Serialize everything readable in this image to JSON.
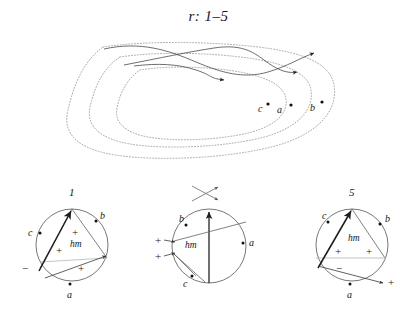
{
  "figure": {
    "title": "r: 1–5",
    "type": "braid-and-circle-diagram"
  },
  "braid": {
    "name": "dotted-loop-braid",
    "point_labels": [
      {
        "label": "c",
        "x": 262,
        "y": 110
      },
      {
        "label": "a",
        "x": 278,
        "y": 110
      },
      {
        "label": "b",
        "x": 309,
        "y": 110
      }
    ],
    "arrow_count": 3,
    "dotted_loop_count": 3,
    "strand_count": 3
  },
  "circles": [
    {
      "id": "circle-1",
      "top_label": "1",
      "center_label": "hm",
      "points": [
        {
          "label": "b",
          "position": "upper-right"
        },
        {
          "label": "c",
          "position": "left"
        },
        {
          "label": "a",
          "position": "bottom"
        }
      ],
      "signs": [
        {
          "sign": "+",
          "position": "inner-top"
        },
        {
          "sign": "+",
          "position": "inner-left"
        },
        {
          "sign": "+",
          "position": "inner-bottom"
        },
        {
          "sign": "−",
          "position": "outer-left"
        }
      ]
    },
    {
      "id": "circle-2",
      "top_label": "",
      "center_label": "hm",
      "points": [
        {
          "label": "b",
          "position": "upper-left"
        },
        {
          "label": "a",
          "position": "right"
        },
        {
          "label": "c",
          "position": "lower-left"
        }
      ],
      "signs": [
        {
          "sign": "+",
          "position": "outer-left-upper"
        },
        {
          "sign": "+",
          "position": "outer-left-lower"
        }
      ],
      "crossing_mark": "x-crossing-icon"
    },
    {
      "id": "circle-3",
      "top_label": "5",
      "center_label": "hm",
      "points": [
        {
          "label": "c",
          "position": "upper-left"
        },
        {
          "label": "b",
          "position": "upper-right"
        },
        {
          "label": "a",
          "position": "bottom"
        }
      ],
      "signs": [
        {
          "sign": "+",
          "position": "inner-left"
        },
        {
          "sign": "+",
          "position": "inner-right"
        },
        {
          "sign": "−",
          "position": "inner-lower"
        },
        {
          "sign": "+",
          "position": "outer-lower-right"
        }
      ]
    }
  ],
  "colors": {
    "ink": "#1a1a1a",
    "dotted": "#9a9a9a",
    "strand": "#4a4a4a",
    "background": "#ffffff"
  }
}
